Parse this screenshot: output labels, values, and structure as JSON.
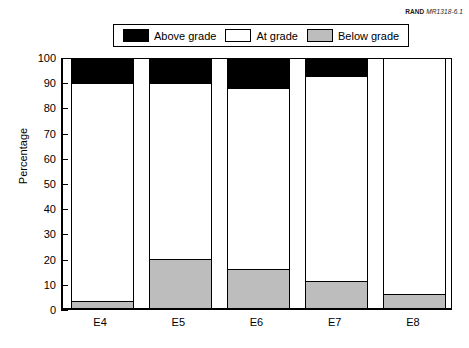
{
  "source_credit": {
    "publisher": "RAND",
    "document_id": "MR1318-6.1"
  },
  "legend": {
    "entries": [
      {
        "label": "Above grade",
        "key": "above",
        "color": "#000000"
      },
      {
        "label": "At grade",
        "key": "at",
        "color": "#ffffff"
      },
      {
        "label": "Below grade",
        "key": "below",
        "color": "#bdbdbd"
      }
    ]
  },
  "chart_data": {
    "type": "bar",
    "stacked": true,
    "title": "",
    "xlabel": "",
    "ylabel": "Percentage",
    "ylim": [
      0,
      100
    ],
    "ytick_step": 10,
    "yticks": [
      0,
      10,
      20,
      30,
      40,
      50,
      60,
      70,
      80,
      90,
      100
    ],
    "ytick_labels": [
      "0",
      "10",
      "20",
      "30",
      "40",
      "50",
      "60",
      "70",
      "80",
      "90",
      "100"
    ],
    "grid": false,
    "legend_position": "top-center",
    "categories": [
      "E4",
      "E5",
      "E6",
      "E7",
      "E8"
    ],
    "series": [
      {
        "name": "Below grade",
        "key": "below",
        "color": "#bdbdbd",
        "values": [
          3,
          20,
          16,
          11,
          6
        ]
      },
      {
        "name": "At grade",
        "key": "at",
        "color": "#ffffff",
        "values": [
          87,
          70,
          72,
          82,
          94
        ]
      },
      {
        "name": "Above grade",
        "key": "above",
        "color": "#000000",
        "values": [
          10,
          10,
          12,
          7,
          0
        ]
      }
    ]
  }
}
